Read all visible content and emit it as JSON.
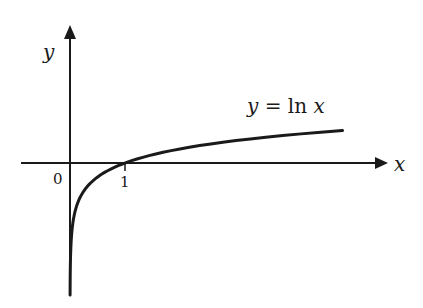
{
  "chart_data": {
    "type": "line",
    "title": "",
    "xlabel": "x",
    "ylabel": "y",
    "origin_label": "0",
    "x_ticks": [
      {
        "value": 1,
        "label": "1"
      }
    ],
    "series": [
      {
        "name": "y = ln x",
        "function": "ln(x)",
        "x": [
          0.002,
          0.01,
          0.05,
          0.1,
          0.2,
          0.3,
          0.5,
          0.7,
          1,
          1.5,
          2,
          3,
          4,
          5,
          5.38
        ],
        "y": [
          -6.2,
          -4.6,
          -3.0,
          -2.3,
          -1.61,
          -1.2,
          -0.69,
          -0.36,
          0,
          0.41,
          0.69,
          1.1,
          1.39,
          1.61,
          1.68
        ]
      }
    ],
    "xlim": [
      -0.9,
      5.7
    ],
    "ylim": [
      -6.6,
      6.8
    ],
    "grid": false,
    "legend": "none",
    "annotations": [
      {
        "text": "y = ln x",
        "near_x": 4.0,
        "near_y": 2.6
      }
    ],
    "line_color": "#1a1a1a"
  },
  "labels": {
    "y_axis": "y",
    "x_axis": "x",
    "origin": "0",
    "tick_1": "1",
    "curve_y": "y",
    "curve_eq": " = ",
    "curve_fn": "ln",
    "curve_x": "x"
  }
}
